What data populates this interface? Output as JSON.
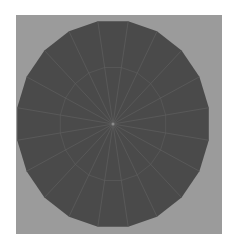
{
  "figure": {
    "panel_color": "#9b9b9b",
    "disk_color": "#4a4a4a",
    "line_color": "#5e5e5e",
    "center_dot_color": "#8a8a8a",
    "sides": 20,
    "spokes": 20,
    "center": [
      113,
      124
    ],
    "radius_x": 97,
    "radius_y": 104,
    "inner_ring_ratio": 0.55
  }
}
